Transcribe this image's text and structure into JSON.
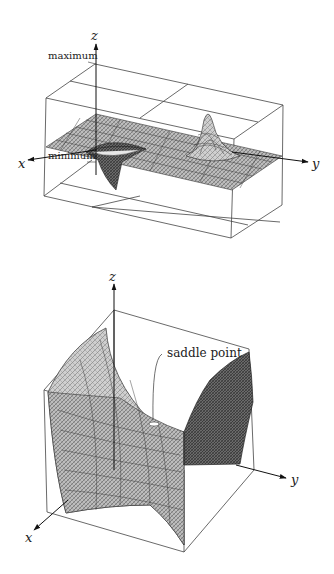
{
  "figure_top": {
    "title": "Surface with a local maximum and minimum",
    "axes": {
      "x": "x",
      "y": "y",
      "z": "z"
    },
    "annotations": {
      "maximum": "maximum",
      "minimum": "minimum"
    }
  },
  "figure_bottom": {
    "title": "Saddle surface",
    "axes": {
      "x": "x",
      "y": "y",
      "z": "z"
    },
    "annotations": {
      "saddle": "saddle point"
    }
  },
  "colors": {
    "line": "#333333",
    "surface_light": "#bdbdbd",
    "surface_mid": "#9a9a9a",
    "surface_dark": "#5e5e5e",
    "background": "#ffffff"
  }
}
